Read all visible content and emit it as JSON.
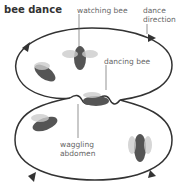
{
  "title": "bee dance",
  "labels": {
    "watching_bee": "watching bee",
    "dance_direction_1": "dance",
    "dance_direction_2": "direction",
    "dancing_bee": "dancing bee",
    "waggling_abdomen_1": "waggling",
    "waggling_abdomen_2": "abdomen"
  },
  "colors": {
    "path": "#333333",
    "label": "#666666",
    "bee": "#555555"
  }
}
